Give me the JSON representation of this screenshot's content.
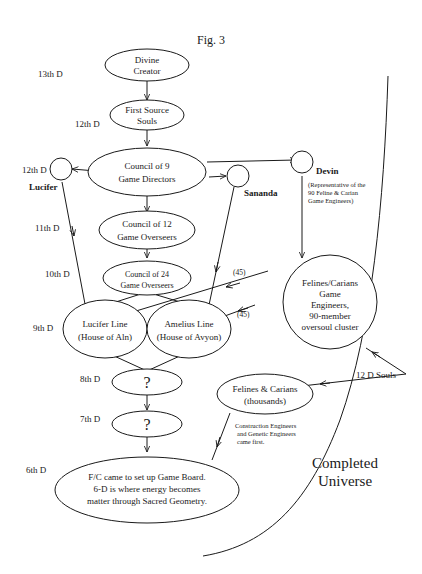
{
  "figure": {
    "title": "Fig. 3"
  },
  "dimension_labels": {
    "d13": "13th D",
    "d12a": "12th D",
    "d12b": "12th D",
    "d11": "11th D",
    "d10": "10th D",
    "d9": "9th D",
    "d8": "8th D",
    "d7": "7th D",
    "d6": "6th D"
  },
  "nodes": {
    "divine_creator": [
      "Divine",
      "Creator"
    ],
    "first_source_souls": [
      "First Source",
      "Souls"
    ],
    "council_9": [
      "Council of 9",
      "Game Directors"
    ],
    "council_12": [
      "Council of 12",
      "Game Overseers"
    ],
    "council_24": [
      "Council of 24",
      "Game Overseers"
    ],
    "lucifer_line": [
      "Lucifer Line",
      "(House of Aln)"
    ],
    "amelius_line": [
      "Amelius Line",
      "(House of Avyon)"
    ],
    "unknown_8d": "?",
    "unknown_7d": "?",
    "sixth_d": [
      "F/C came to set up Game Board.",
      "6-D is where energy becomes",
      "matter through Sacred Geometry."
    ],
    "felines_engineers": [
      "Felines/Carians",
      "Game",
      "Engineers,",
      "90-member",
      "oversoul cluster"
    ],
    "felines_thousands": [
      "Felines & Carians",
      "(thousands)"
    ]
  },
  "beings": {
    "lucifer": "Lucifer",
    "sananda": "Sananda",
    "devin": "Devin",
    "devin_note": [
      "(Representative of the",
      "90 Feline & Carian",
      "Game Engineers)"
    ],
    "twelve_d_souls": "12 D Souls"
  },
  "edge_labels": {
    "upper_45": "(45)",
    "lower_45": "(45)"
  },
  "notes": {
    "construction": [
      "Construction Engineers",
      "and Genetic Engineers",
      "came first."
    ]
  },
  "region": {
    "completed_universe": [
      "Completed",
      "Universe"
    ]
  }
}
